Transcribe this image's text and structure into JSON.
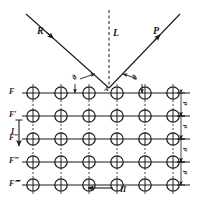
{
  "figure": {
    "type": "crystal-lattice-bragg-diffraction-diagram",
    "background_color": "#ffffff",
    "ink_color": "#1a1a1a",
    "width": 197,
    "height": 200
  },
  "rays": {
    "incident": {
      "label": "R",
      "name": "incident-ray",
      "x1": 26,
      "y1": 14,
      "x2": 109,
      "y2": 88,
      "label_x": 37,
      "label_y": 26,
      "arrow_at": 0.33
    },
    "normal": {
      "label": "L",
      "name": "normal-line",
      "x1": 109,
      "y1": 10,
      "x2": 109,
      "y2": 88,
      "label_x": 113,
      "label_y": 28,
      "style": "dashed"
    },
    "reflected": {
      "label": "P",
      "name": "reflected-ray",
      "x1": 109,
      "y1": 88,
      "x2": 180,
      "y2": 14,
      "label_x": 153,
      "label_y": 26,
      "arrow_at": 0.72
    }
  },
  "angles": {
    "left": {
      "label": "ϑ",
      "name": "incidence-angle",
      "label_x": 73,
      "label_y": 74
    },
    "right": {
      "label": "ϑ",
      "name": "reflection-angle",
      "label_x": 133,
      "label_y": 74
    }
  },
  "points": {
    "incidence": {
      "label": "A",
      "name": "point-of-incidence",
      "x": 109,
      "y": 88,
      "label_x": 104,
      "label_y": 86
    }
  },
  "lattice": {
    "name": "atom-lattice",
    "columns": 6,
    "rows": 5,
    "x_start": 33,
    "x_step": 28,
    "y_start": 93,
    "y_step": 23,
    "atom_radius": 6.2,
    "left_margin_x": 22,
    "right_margin_x": 190,
    "row_labels": [
      {
        "label": "F",
        "name": "row-label-f0"
      },
      {
        "label": "F′",
        "name": "row-label-f1"
      },
      {
        "label": "F″",
        "name": "row-label-f2"
      },
      {
        "label": "F‴",
        "name": "row-label-f3"
      },
      {
        "label": "F⁗",
        "name": "row-label-f4"
      }
    ],
    "spacing_labels": [
      {
        "label": "d",
        "name": "spacing-d-1"
      },
      {
        "label": "d",
        "name": "spacing-d-2"
      },
      {
        "label": "d",
        "name": "spacing-d-3"
      },
      {
        "label": "d",
        "name": "spacing-d-4"
      }
    ]
  },
  "directions": {
    "vertical": {
      "label": "I",
      "name": "direction-i",
      "arrow": "down",
      "label_x": 11,
      "label_y": 128,
      "x": 19,
      "y1": 120,
      "y2": 146
    },
    "horizontal": {
      "label": "II",
      "name": "direction-ii",
      "arrow": "left",
      "label_x": 120,
      "label_y": 186,
      "y": 188,
      "x1": 113,
      "x2": 88
    }
  }
}
